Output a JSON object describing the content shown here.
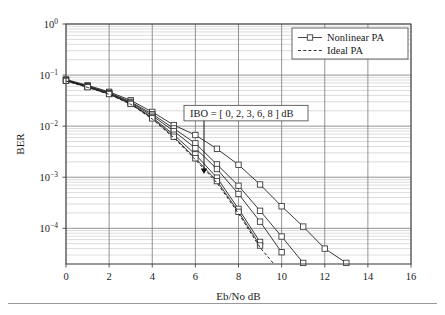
{
  "chart_data": {
    "type": "line",
    "title": "",
    "xlabel": "Eb/No  dB",
    "ylabel": "BER",
    "xlim": [
      0,
      16
    ],
    "ylim": [
      2e-05,
      1.0
    ],
    "yscale": "log",
    "xticks": [
      0,
      2,
      4,
      6,
      8,
      10,
      12,
      14,
      16
    ],
    "xticklabels": [
      "0",
      "2",
      "4",
      "6",
      "8",
      "10",
      "12",
      "14",
      "16"
    ],
    "yticks": [
      1.0,
      0.1,
      0.01,
      0.001,
      0.0001
    ],
    "yticklabels": [
      "10^0",
      "10^-1",
      "10^-2",
      "10^-3",
      "10^-4"
    ],
    "ytick_mantissa": [
      "10",
      "10",
      "10",
      "10",
      "10"
    ],
    "ytick_exponent": [
      "0",
      "−1",
      "−2",
      "−3",
      "−4"
    ],
    "grid": true,
    "minor_grid": true,
    "legend_position": "upper right",
    "legend": [
      {
        "label": "Nonlinear PA",
        "style": "solid-with-square-marker"
      },
      {
        "label": "Ideal PA",
        "style": "dashed"
      }
    ],
    "annotation": {
      "text": "IBO = [ 0, 2, 3, 6, 8 ] dB",
      "x": 6.4,
      "y": 0.018,
      "arrow_to_x": 6.4,
      "arrow_to_y": 0.00115,
      "boxed": true
    },
    "series": [
      {
        "name": "Nonlinear PA IBO = 0 dB",
        "marker": "square",
        "linestyle": "solid",
        "x": [
          0,
          1,
          2,
          3,
          4,
          5,
          6,
          7,
          8,
          9,
          10,
          11,
          12,
          13
        ],
        "y": [
          0.082,
          0.063,
          0.047,
          0.032,
          0.019,
          0.0105,
          0.0067,
          0.0036,
          0.00175,
          0.00072,
          0.00027,
          0.000108,
          4e-05,
          2.1e-05
        ]
      },
      {
        "name": "Nonlinear PA IBO = 2 dB",
        "marker": "square",
        "linestyle": "solid",
        "x": [
          0,
          1,
          2,
          3,
          4,
          5,
          6,
          7,
          8,
          9,
          10,
          11
        ],
        "y": [
          0.08,
          0.061,
          0.045,
          0.03,
          0.0172,
          0.009,
          0.0046,
          0.00178,
          0.00068,
          0.00022,
          6.9e-05,
          2.1e-05
        ]
      },
      {
        "name": "Nonlinear PA IBO = 3 dB",
        "marker": "square",
        "linestyle": "solid",
        "x": [
          0,
          1,
          2,
          3,
          4,
          5,
          6,
          7,
          8,
          9,
          10
        ],
        "y": [
          0.079,
          0.06,
          0.044,
          0.029,
          0.016,
          0.008,
          0.0037,
          0.00145,
          0.00047,
          0.000135,
          3.4e-05
        ]
      },
      {
        "name": "Nonlinear PA IBO = 6 dB",
        "marker": "square",
        "linestyle": "solid",
        "x": [
          0,
          1,
          2,
          3,
          4,
          5,
          6,
          7,
          8,
          9
        ],
        "y": [
          0.078,
          0.059,
          0.043,
          0.0278,
          0.0148,
          0.0068,
          0.0028,
          0.00098,
          0.00024,
          5.4e-05
        ]
      },
      {
        "name": "Nonlinear PA IBO = 8 dB",
        "marker": "square",
        "linestyle": "solid",
        "x": [
          0,
          1,
          2,
          3,
          4,
          5,
          6,
          7,
          8,
          9
        ],
        "y": [
          0.077,
          0.058,
          0.0425,
          0.0272,
          0.0142,
          0.0062,
          0.00235,
          0.00084,
          0.00021,
          4.6e-05
        ]
      },
      {
        "name": "Ideal PA",
        "marker": "none",
        "linestyle": "dashed",
        "x": [
          0,
          1,
          2,
          3,
          4,
          5,
          6,
          7,
          8,
          9,
          9.6
        ],
        "y": [
          0.0765,
          0.0575,
          0.042,
          0.0268,
          0.0138,
          0.0059,
          0.0022,
          0.00078,
          0.000195,
          4.2e-05,
          2.1e-05
        ]
      }
    ]
  },
  "axis": {
    "y_label": "BER",
    "x_label": "Eb/No  dB"
  }
}
